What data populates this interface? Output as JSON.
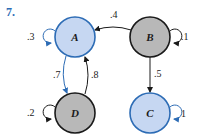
{
  "problem_number": "7.",
  "colors": {
    "blue_fill": "#c6d7f2",
    "blue_stroke": "#2d6cb5",
    "gray_fill": "#b8b8b8",
    "gray_stroke": "#1a1a1a"
  },
  "nodes": [
    {
      "id": "A",
      "label": "A",
      "style": "blue"
    },
    {
      "id": "B",
      "label": "B",
      "style": "gray"
    },
    {
      "id": "C",
      "label": "C",
      "style": "blue"
    },
    {
      "id": "D",
      "label": "D",
      "style": "gray"
    }
  ],
  "edges": [
    {
      "from": "A",
      "to": "A",
      "label": ".3"
    },
    {
      "from": "B",
      "to": "B",
      "label": ".1"
    },
    {
      "from": "D",
      "to": "D",
      "label": ".2"
    },
    {
      "from": "C",
      "to": "C",
      "label": "1"
    },
    {
      "from": "B",
      "to": "A",
      "label": ".4"
    },
    {
      "from": "B",
      "to": "C",
      "label": ".5"
    },
    {
      "from": "A",
      "to": "D",
      "label": ".7"
    },
    {
      "from": "D",
      "to": "A",
      "label": ".8"
    }
  ]
}
